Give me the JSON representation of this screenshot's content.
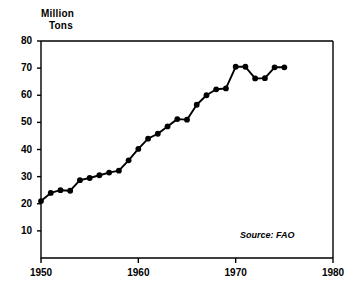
{
  "chart_data": {
    "type": "line",
    "title": "Million Tons",
    "title_lines": [
      "Million",
      "Tons"
    ],
    "xlabel": "",
    "ylabel": "Million Tons",
    "xlim": [
      1950,
      1980
    ],
    "ylim": [
      0,
      80
    ],
    "grid": false,
    "legend": null,
    "marker": "filled-circle",
    "line_color": "#000000",
    "marker_color": "#000000",
    "background_color": "#ffffff",
    "xticks": [
      1950,
      1960,
      1970,
      1980
    ],
    "xtick_labels": [
      "1950",
      "1960",
      "1970",
      "1980"
    ],
    "yticks": [
      10,
      20,
      30,
      40,
      50,
      60,
      70,
      80
    ],
    "ytick_labels": [
      "10",
      "20",
      "30",
      "40",
      "50",
      "60",
      "70",
      "80"
    ],
    "x": [
      1950,
      1951,
      1952,
      1953,
      1954,
      1955,
      1956,
      1957,
      1958,
      1959,
      1960,
      1961,
      1962,
      1963,
      1964,
      1965,
      1966,
      1967,
      1968,
      1969,
      1970,
      1971,
      1972,
      1973,
      1974,
      1975
    ],
    "values": [
      21,
      24,
      25,
      24.8,
      28.7,
      29.5,
      30.5,
      31.5,
      32.2,
      36,
      40.2,
      44,
      45.8,
      48.5,
      51.2,
      51,
      56.5,
      60,
      62.2,
      62.5,
      70.5,
      70.5,
      66.2,
      66.3,
      70.3,
      70.3
    ],
    "annotations": [
      {
        "text": "Source: FAO",
        "x_frac": 0.68,
        "y_frac": 0.87,
        "style": "italic"
      }
    ]
  },
  "axis_titles": {
    "line1": "Million",
    "line2": "Tons"
  },
  "source": {
    "label": "Source: FAO"
  }
}
